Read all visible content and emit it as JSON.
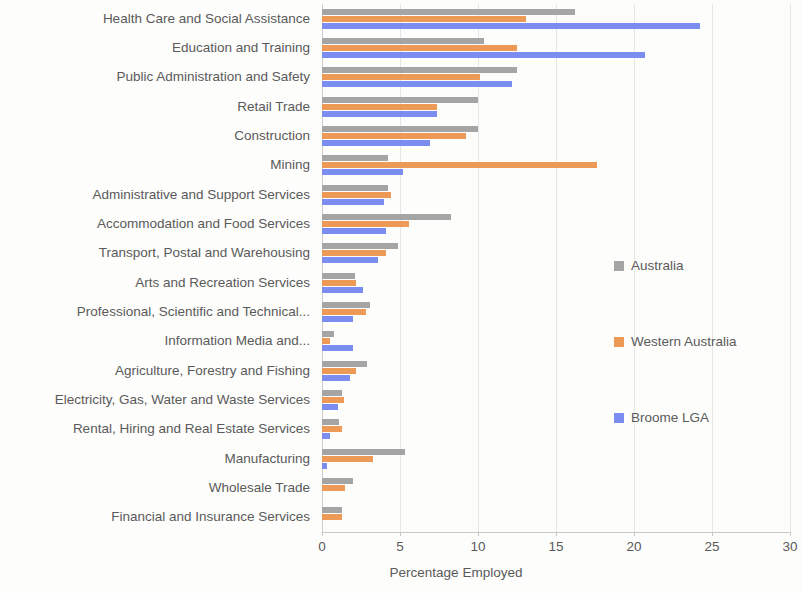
{
  "chart_data": {
    "type": "bar",
    "orientation": "horizontal",
    "title": "",
    "xlabel": "Percentage Employed",
    "ylabel": "",
    "xlim": [
      0,
      30
    ],
    "xticks": [
      0,
      5,
      10,
      15,
      20,
      25,
      30
    ],
    "grid": true,
    "legend_position": "right",
    "categories": [
      "Health Care and Social Assistance",
      "Education and Training",
      "Public Administration and Safety",
      "Retail Trade",
      "Construction",
      "Mining",
      "Administrative and Support Services",
      "Accommodation and Food Services",
      "Transport, Postal and Warehousing",
      "Arts and Recreation Services",
      "Professional, Scientific and Technical...",
      "Information Media and...",
      "Agriculture, Forestry and Fishing",
      "Electricity, Gas, Water and Waste Services",
      "Rental, Hiring and Real Estate Services",
      "Manufacturing",
      "Wholesale Trade",
      "Financial and Insurance Services"
    ],
    "series": [
      {
        "name": "Australia",
        "color": "#a5a5a5",
        "values": [
          16.2,
          10.4,
          12.5,
          10.0,
          10.0,
          4.2,
          4.2,
          8.3,
          4.9,
          2.1,
          3.1,
          0.8,
          2.9,
          1.3,
          1.1,
          5.3,
          2.0,
          1.3
        ]
      },
      {
        "name": "Western Australia",
        "color": "#ed9a56",
        "values": [
          13.1,
          12.5,
          10.1,
          7.4,
          9.2,
          17.6,
          4.4,
          5.6,
          4.1,
          2.2,
          2.8,
          0.5,
          2.2,
          1.4,
          1.3,
          3.3,
          1.5,
          1.3
        ]
      },
      {
        "name": "Broome LGA",
        "color": "#7b8df0",
        "values": [
          24.2,
          20.7,
          12.2,
          7.4,
          6.9,
          5.2,
          4.0,
          4.1,
          3.6,
          2.6,
          2.0,
          2.0,
          1.8,
          1.0,
          0.5,
          0.3,
          0.0,
          0.0
        ]
      }
    ],
    "legend": [
      {
        "label": "Australia",
        "color": "#a5a5a5"
      },
      {
        "label": "Western Australia",
        "color": "#ed9a56"
      },
      {
        "label": "Broome LGA",
        "color": "#7b8df0"
      }
    ]
  }
}
